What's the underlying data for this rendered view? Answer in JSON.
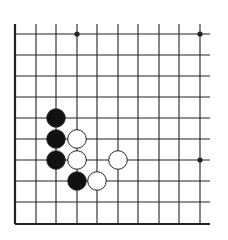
{
  "diagram": {
    "type": "go-board-fragment",
    "colors": {
      "background": "#ffffff",
      "line": "#222222",
      "black_stone": "#111111",
      "white_stone": "#ffffff",
      "stone_outline": "#222222"
    },
    "grid": {
      "x_lines": [
        15,
        36,
        56,
        77,
        97,
        118,
        138,
        159,
        179,
        200
      ],
      "y_lines": [
        34,
        55,
        76,
        97,
        118,
        139,
        160,
        181,
        202,
        224
      ],
      "h_extent": [
        15,
        210
      ],
      "v_extent": [
        24,
        224
      ],
      "left_edge": true,
      "bottom_edge": true
    },
    "hoshi": [
      {
        "col": 3,
        "row": 0
      },
      {
        "col": 9,
        "row": 0
      },
      {
        "col": 9,
        "row": 6
      }
    ],
    "stones": [
      {
        "color": "black",
        "col": 2,
        "row": 4
      },
      {
        "color": "black",
        "col": 2,
        "row": 5
      },
      {
        "color": "black",
        "col": 2,
        "row": 6
      },
      {
        "color": "black",
        "col": 3,
        "row": 7
      },
      {
        "color": "white",
        "col": 3,
        "row": 5
      },
      {
        "color": "white",
        "col": 3,
        "row": 6
      },
      {
        "color": "white",
        "col": 5,
        "row": 6
      },
      {
        "color": "white",
        "col": 4,
        "row": 7
      }
    ]
  }
}
